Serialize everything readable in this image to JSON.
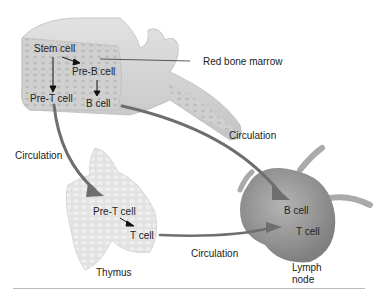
{
  "diagram": {
    "type": "lymphocyte development and circulation",
    "labels": {
      "stem_cell": "Stem cell",
      "pre_b_cell": "Pre-B cell",
      "pre_t_cell_marrow": "Pre-T cell",
      "b_cell_marrow": "B cell",
      "red_bone_marrow": "Red bone marrow",
      "circulation_left": "Circulation",
      "circulation_right": "Circulation",
      "circulation_bottom": "Circulation",
      "pre_t_cell_thymus": "Pre-T cell",
      "t_cell_thymus": "T cell",
      "thymus": "Thymus",
      "b_cell_node": "B cell",
      "t_cell_node": "T cell",
      "lymph_node_line1": "Lymph",
      "lymph_node_line2": "node"
    },
    "colors": {
      "bone": "#d4d4d4",
      "marrow": "#cfcfcf",
      "node": "#9a9a9a",
      "arrow": "#6e6e6e",
      "thymus": "#dcdcdc",
      "text": "#222222"
    }
  }
}
